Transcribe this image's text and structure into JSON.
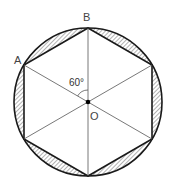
{
  "diagram": {
    "type": "geometry",
    "center": {
      "label": "O",
      "x": 88,
      "y": 102
    },
    "circle_radius": 74,
    "labels": {
      "vertex_a": "A",
      "vertex_b": "B",
      "center": "O",
      "angle": "60°"
    },
    "hexagon_vertices": [
      {
        "name": "B",
        "x": 88,
        "y": 28
      },
      {
        "name": "upper-right",
        "x": 152,
        "y": 65
      },
      {
        "name": "lower-right",
        "x": 152,
        "y": 139
      },
      {
        "name": "bottom",
        "x": 88,
        "y": 176
      },
      {
        "name": "lower-left",
        "x": 24,
        "y": 139
      },
      {
        "name": "A",
        "x": 24,
        "y": 65
      }
    ],
    "colors": {
      "stroke": "#1a1a1a",
      "thin_line": "#555555",
      "hatch": "#555555",
      "background": "#ffffff"
    }
  }
}
